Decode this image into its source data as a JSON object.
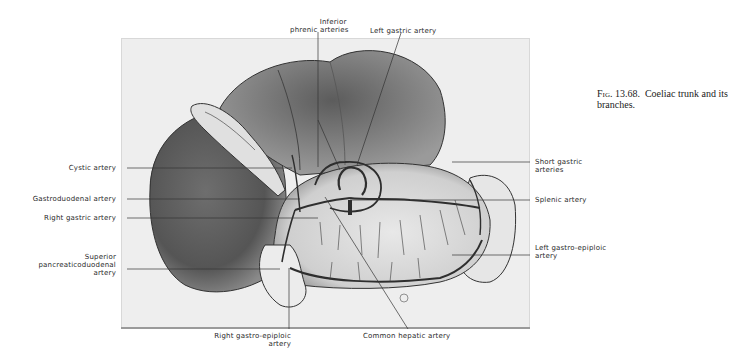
{
  "figure": {
    "number": "13.68.",
    "fig_prefix": "Fig.",
    "caption_line1": "Coeliac trunk and its",
    "caption_line2": "branches."
  },
  "labels": {
    "inferior_phrenic_1": "Inferior",
    "inferior_phrenic_2": "phrenic arteries",
    "left_gastric": "Left gastric artery",
    "cystic": "Cystic artery",
    "gastroduodenal": "Gastroduodenal artery",
    "right_gastric": "Right gastric artery",
    "sup_pancreatico_1": "Superior",
    "sup_pancreatico_2": "pancreaticoduodenal",
    "sup_pancreatico_3": "artery",
    "short_gastric_1": "Short gastric",
    "short_gastric_2": "arteries",
    "splenic": "Splenic artery",
    "left_gastro_epiploic_1": "Left gastro-epiploic",
    "left_gastro_epiploic_2": "artery",
    "right_gastro_epiploic_1": "Right gastro-epiploic",
    "right_gastro_epiploic_2": "artery",
    "common_hepatic": "Common hepatic artery"
  },
  "colors": {
    "plate_bg": "#eeeeee",
    "organ_dark": "#5a5a5a",
    "organ_mid": "#8a8a8a",
    "organ_light": "#e4e4e4",
    "vessel": "#2e2e2e",
    "leader": "#333333"
  }
}
